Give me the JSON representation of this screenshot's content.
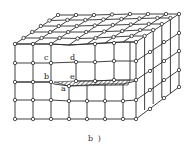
{
  "diagram": {
    "type": "crystal-lattice-edge-dislocation",
    "caption": "b )",
    "labels": {
      "a": "a",
      "b": "b",
      "c": "c",
      "d": "d",
      "e": "e"
    },
    "colors": {
      "line": "#2a2a2a",
      "node_fill": "#ffffff",
      "hatch": "#2a2a2a",
      "background": "#ffffff"
    }
  }
}
